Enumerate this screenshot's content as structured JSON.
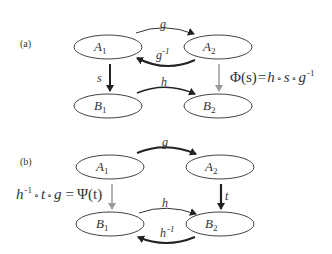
{
  "colors": {
    "ink": "#333333",
    "gray_arrow": "#9a9a9a",
    "background": "#ffffff"
  },
  "panels": [
    {
      "label": "(a)",
      "nodes": {
        "A1": {
          "base": "A",
          "sub": "1"
        },
        "A2": {
          "base": "A",
          "sub": "2"
        },
        "B1": {
          "base": "B",
          "sub": "1"
        },
        "B2": {
          "base": "B",
          "sub": "2"
        }
      },
      "edges": {
        "g": {
          "label": "g",
          "from": "A1",
          "to": "A2"
        },
        "g_inv": {
          "label": "g",
          "sup": "-1",
          "from": "A2",
          "to": "A1"
        },
        "s": {
          "label": "s",
          "from": "A1",
          "to": "B1"
        },
        "h": {
          "label": "h",
          "from": "B1",
          "to": "B2"
        },
        "phi": {
          "from": "A2",
          "to": "B2"
        }
      },
      "equation": {
        "lhs": "Φ(s)",
        "eq": "=",
        "rhs_h": "h",
        "circ1": "∘",
        "rhs_s": "s",
        "circ2": "∘",
        "rhs_g": "g",
        "rhs_sup": "-1"
      }
    },
    {
      "label": "(b)",
      "nodes": {
        "A1": {
          "base": "A",
          "sub": "1"
        },
        "A2": {
          "base": "A",
          "sub": "2"
        },
        "B1": {
          "base": "B",
          "sub": "1"
        },
        "B2": {
          "base": "B",
          "sub": "2"
        }
      },
      "edges": {
        "g": {
          "label": "g",
          "from": "A1",
          "to": "A2"
        },
        "t": {
          "label": "t",
          "from": "A2",
          "to": "B2"
        },
        "h": {
          "label": "h",
          "from": "B1",
          "to": "B2"
        },
        "h_inv": {
          "label": "h",
          "sup": "-1",
          "from": "B2",
          "to": "B1"
        },
        "psi": {
          "from": "A1",
          "to": "B1"
        }
      },
      "equation": {
        "lhs_h": "h",
        "lhs_sup": "-1",
        "circ1": "∘",
        "lhs_t": "t",
        "circ2": "∘",
        "lhs_g": "g",
        "eq": "=",
        "rhs": "Ψ(t)"
      }
    }
  ]
}
